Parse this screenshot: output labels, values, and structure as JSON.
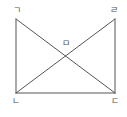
{
  "diagram": {
    "type": "geometry",
    "line_color": "#555555",
    "points": [
      {
        "id": "A",
        "label": "ㄱ",
        "x": 16,
        "y": 19,
        "label_x": 17,
        "label_y": 10
      },
      {
        "id": "B",
        "label": "ㄴ",
        "x": 16,
        "y": 93,
        "label_x": 16,
        "label_y": 101
      },
      {
        "id": "C",
        "label": "ㄷ",
        "x": 115,
        "y": 93,
        "label_x": 115,
        "label_y": 101
      },
      {
        "id": "D",
        "label": "ㄹ",
        "x": 115,
        "y": 19,
        "label_x": 114,
        "label_y": 10
      },
      {
        "id": "E",
        "label": "ㅁ",
        "x": 66,
        "y": 56,
        "label_x": 66,
        "label_y": 43
      }
    ],
    "segments": [
      {
        "from": "A",
        "to": "B"
      },
      {
        "from": "B",
        "to": "C"
      },
      {
        "from": "C",
        "to": "D"
      },
      {
        "from": "A",
        "to": "C"
      },
      {
        "from": "D",
        "to": "B"
      }
    ]
  },
  "labels": {
    "top_left": "ㄱ",
    "bottom_left": "ㄴ",
    "bottom_right": "ㄷ",
    "top_right": "ㄹ",
    "intersection": "ㅁ"
  }
}
